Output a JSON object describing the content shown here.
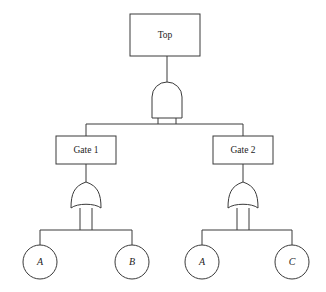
{
  "diagram": {
    "type": "fault-tree",
    "colors": {
      "stroke": "#3a3a3a",
      "fill": "#ffffff",
      "text": "#1c1c1c",
      "background": "#ffffff"
    },
    "nodes": {
      "top_event": {
        "label": "Top",
        "shape": "rectangle",
        "x": 130,
        "y": 14,
        "width": 70,
        "height": 42
      },
      "top_gate": {
        "label": "",
        "gate_type": "AND",
        "shape": "and-gate",
        "x": 152,
        "y": 82,
        "width": 30,
        "height": 36
      },
      "gate_1": {
        "label": "Gate 1",
        "shape": "rectangle",
        "x": 56,
        "y": 136,
        "width": 60,
        "height": 28
      },
      "gate_2": {
        "label": "Gate 2",
        "shape": "rectangle",
        "x": 213,
        "y": 136,
        "width": 60,
        "height": 28
      },
      "or_gate_left": {
        "label": "",
        "gate_type": "OR",
        "shape": "or-gate",
        "x": 71,
        "y": 182,
        "width": 30,
        "height": 30
      },
      "or_gate_right": {
        "label": "",
        "gate_type": "OR",
        "shape": "or-gate",
        "x": 228,
        "y": 182,
        "width": 30,
        "height": 30
      },
      "basic_event_a_left": {
        "label": "A",
        "shape": "circle",
        "cx": 40,
        "cy": 262,
        "r": 17
      },
      "basic_event_b": {
        "label": "B",
        "shape": "circle",
        "cx": 132,
        "cy": 262,
        "r": 17
      },
      "basic_event_a_right": {
        "label": "A",
        "shape": "circle",
        "cx": 202,
        "cy": 262,
        "r": 17
      },
      "basic_event_c": {
        "label": "C",
        "shape": "circle",
        "cx": 292,
        "cy": 262,
        "r": 17
      }
    },
    "edges": [
      {
        "from": "top_event",
        "to": "top_gate"
      },
      {
        "from": "top_gate",
        "to": "gate_1"
      },
      {
        "from": "top_gate",
        "to": "gate_2"
      },
      {
        "from": "gate_1",
        "to": "or_gate_left"
      },
      {
        "from": "gate_2",
        "to": "or_gate_right"
      },
      {
        "from": "or_gate_left",
        "to": "basic_event_a_left"
      },
      {
        "from": "or_gate_left",
        "to": "basic_event_b"
      },
      {
        "from": "or_gate_right",
        "to": "basic_event_a_right"
      },
      {
        "from": "or_gate_right",
        "to": "basic_event_c"
      }
    ]
  }
}
